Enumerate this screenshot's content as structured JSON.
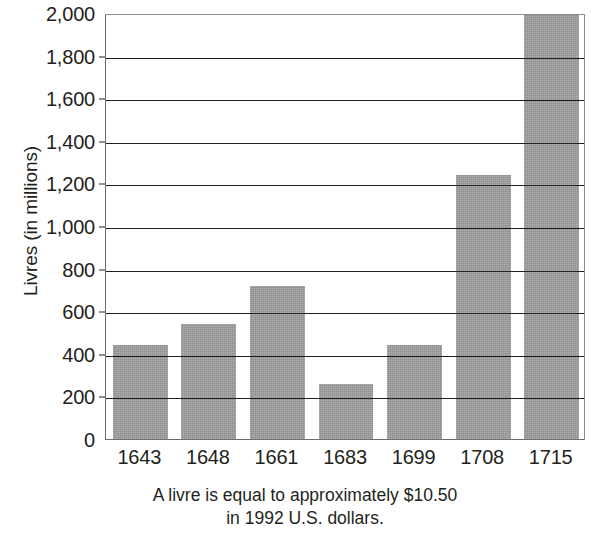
{
  "chart_data": {
    "type": "bar",
    "title": "",
    "xlabel": "",
    "ylabel": "Livres (in millions)",
    "categories": [
      "1643",
      "1648",
      "1661",
      "1683",
      "1699",
      "1708",
      "1715"
    ],
    "values": [
      440,
      540,
      720,
      260,
      440,
      1240,
      1990
    ],
    "ylim": [
      0,
      2000
    ],
    "ytick_values": [
      0,
      200,
      400,
      600,
      800,
      1000,
      1200,
      1400,
      1600,
      1800,
      2000
    ],
    "ytick_labels": [
      "0",
      "200",
      "400",
      "600",
      "800",
      "1,000",
      "1,200",
      "1,400",
      "1,600",
      "1,800",
      "2,000"
    ],
    "grid": true,
    "legend": false,
    "bar_color": "#8c8c8c",
    "axis_color": "#231f20",
    "series": [
      {
        "name": "French royal revenue",
        "values": [
          440,
          540,
          720,
          260,
          440,
          1240,
          1990
        ]
      }
    ]
  },
  "caption": {
    "line1": "A livre is equal to approximately $10.50",
    "line2": "in 1992 U.S. dollars."
  }
}
